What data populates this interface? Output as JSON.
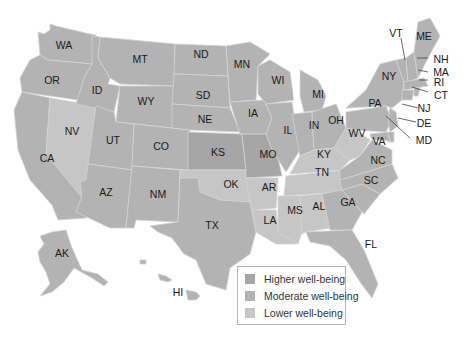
{
  "legend": {
    "items": [
      {
        "label": "Higher well-being",
        "color": "#a6a6a6"
      },
      {
        "label": "Moderate well-being",
        "color": "#b3b3b3"
      },
      {
        "label": "Lower well-being",
        "color": "#c6c6c6"
      }
    ]
  },
  "states": {
    "WA": "WA",
    "OR": "OR",
    "CA": "CA",
    "NV": "NV",
    "ID": "ID",
    "MT": "MT",
    "WY": "WY",
    "UT": "UT",
    "AZ": "AZ",
    "CO": "CO",
    "NM": "NM",
    "ND": "ND",
    "SD": "SD",
    "NE": "NE",
    "KS": "KS",
    "OK": "OK",
    "TX": "TX",
    "MN": "MN",
    "IA": "IA",
    "MO": "MO",
    "AR": "AR",
    "LA": "LA",
    "WI": "WI",
    "IL": "IL",
    "MI": "MI",
    "IN": "IN",
    "OH": "OH",
    "KY": "KY",
    "TN": "TN",
    "MS": "MS",
    "AL": "AL",
    "GA": "GA",
    "FL": "FL",
    "SC": "SC",
    "NC": "NC",
    "VA": "VA",
    "WV": "WV",
    "PA": "PA",
    "NY": "NY",
    "VT": "VT",
    "ME": "ME",
    "NH": "NH",
    "MA": "MA",
    "RI": "RI",
    "CT": "CT",
    "NJ": "NJ",
    "DE": "DE",
    "MD": "MD",
    "AK": "AK",
    "HI": "HI"
  }
}
